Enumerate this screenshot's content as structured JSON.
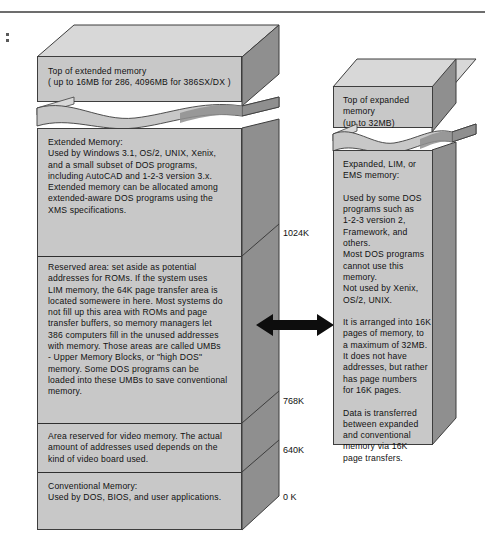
{
  "figure": {
    "title_artifact": ":",
    "arrow_label": "data-transfer-arrow"
  },
  "left_column": {
    "name": "extended-and-conventional-memory-block",
    "header": "Top of extended memory\n( up to 16MB for 286, 4096MB for 386SX/DX  )",
    "sections": [
      {
        "id": "extended-memory",
        "text": "Extended Memory:\nUsed by Windows 3.1, OS/2, UNIX, Xenix,\nand a small subset of DOS programs,\nincluding AutoCAD and 1-2-3 version 3.x.\nExtended memory can be allocated among\nextended-aware DOS programs using the\nXMS specifications."
      },
      {
        "id": "reserved-area-umb",
        "text": "Reserved area: set aside as potential\naddresses for ROMs. If the system uses\nLIM memory, the 64K page transfer area is\nlocated somewere in here. Most systems do\nnot fill up this area with ROMs and  page\ntransfer buffers, so memory managers let\n386 computers fill in the unused addresses\nwith memory. Those areas are called UMBs\n- Upper Memory Blocks, or \"high DOS\"\nmemory. Some DOS  programs can be\nloaded into these UMBs to save conventional\nmemory."
      },
      {
        "id": "video-memory",
        "text": "Area reserved for video memory. The actual\namount of addresses used depends on the\nkind of video board used."
      },
      {
        "id": "conventional-memory",
        "text": "Conventional Memory:\nUsed by DOS, BIOS, and user applications."
      }
    ],
    "ticks": [
      {
        "id": "tick-1024k",
        "label": "1024K"
      },
      {
        "id": "tick-768k",
        "label": "768K"
      },
      {
        "id": "tick-640k",
        "label": "640K"
      },
      {
        "id": "tick-0k",
        "label": "0 K"
      }
    ]
  },
  "right_column": {
    "name": "expanded-memory-block",
    "header": "Top of expanded memory\n(up to 32MB)",
    "sections": [
      {
        "id": "expanded-memory-description",
        "text": "Expanded, LIM, or\nEMS memory:\n\nUsed by some DOS\nprograms such as\n1-2-3 version 2,\nFramework, and others.\nMost DOS programs\ncannot use this memory.\nNot used by Xenix,\nOS/2, UNIX.\n\nIt is arranged into 16K\npages of memory, to\na maximum of 32MB.\nIt does not have\naddresses, but rather\nhas page numbers\nfor 16K pages.\n\nData is transferred\nbetween expanded\nand conventional\nmemory via 16K\npage transfers."
      }
    ]
  },
  "colors": {
    "front_face": "#c8c8c8",
    "top_face": "#d8d8d8",
    "side_face": "#8f8f8f",
    "outline": "#3d3d3d",
    "text": "#111111",
    "rule": "#6d6d6d"
  }
}
